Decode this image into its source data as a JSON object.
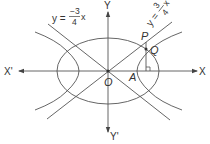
{
  "diagram": {
    "type": "conic-sections",
    "colors": {
      "stroke": "#555555",
      "text": "#333333",
      "background": "#ffffff"
    },
    "axes": {
      "x_positive": "X",
      "x_negative": "X'",
      "y_positive": "Y",
      "y_negative": "Y'"
    },
    "points": {
      "origin": "O",
      "vertex": "A",
      "p": "P",
      "q": "Q"
    },
    "lines": {
      "negative_asymptote": {
        "lhs": "y =",
        "num": "−3",
        "den": "4",
        "var": "x"
      },
      "positive_asymptote": {
        "lhs": "y =",
        "num": "3",
        "den": "4",
        "var": "x"
      }
    },
    "shapes": [
      "ellipse",
      "hyperbola",
      "asymptote y = 3/4 x",
      "asymptote y = -3/4 x",
      "perpendicular PQ to X-axis"
    ]
  }
}
